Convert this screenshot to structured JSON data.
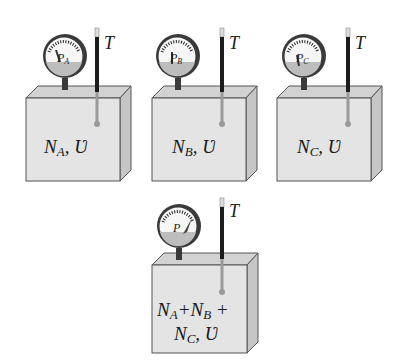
{
  "figure": {
    "colors": {
      "box_front": "#e4e4e4",
      "box_top": "#d2d2d2",
      "box_side": "#c6c6c6",
      "outline": "#555555",
      "gauge_rim": "#3a3a3a",
      "gauge_face": "#f6f6f6",
      "gauge_bottom": "#bdbdbd",
      "thermometer_dark": "#1c1c1c",
      "thermometer_light": "#9a9a9a"
    },
    "containers": [
      {
        "id": "A",
        "gauge_label": "P",
        "gauge_sub": "A",
        "thermo_label": "T",
        "content_main": "N",
        "content_sub": "A",
        "content_tail": ", Ʋ"
      },
      {
        "id": "B",
        "gauge_label": "P",
        "gauge_sub": "B",
        "thermo_label": "T",
        "content_main": "N",
        "content_sub": "B",
        "content_tail": ", Ʋ"
      },
      {
        "id": "C",
        "gauge_label": "P",
        "gauge_sub": "C",
        "thermo_label": "T",
        "content_main": "N",
        "content_sub": "C",
        "content_tail": ", Ʋ"
      }
    ],
    "mixture": {
      "gauge_label": "P",
      "thermo_label": "T",
      "line1_parts": [
        "N",
        "A",
        "+N",
        "B",
        " +"
      ],
      "line2_parts": [
        "N",
        "C",
        ", Ʋ"
      ]
    }
  }
}
